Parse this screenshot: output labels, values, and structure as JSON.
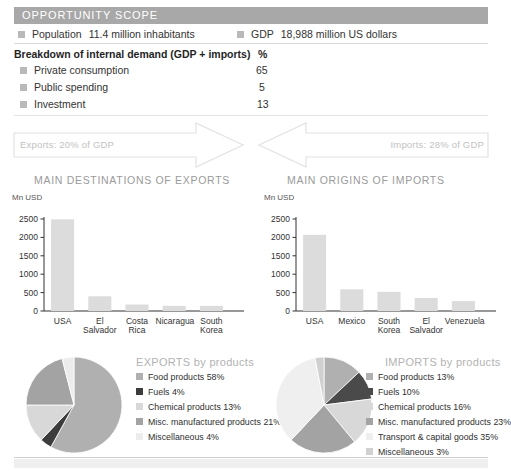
{
  "header": {
    "title": "OPPORTUNITY SCOPE",
    "bar_color": "#a8a8a8"
  },
  "facts": [
    {
      "label": "Population",
      "value": "11.4 million inhabitants"
    },
    {
      "label": "GDP",
      "value": "18,988 million US dollars"
    }
  ],
  "breakdown": {
    "title": "Breakdown of internal demand (GDP + imports)",
    "unit_header": "%",
    "rows": [
      {
        "label": "Private consumption",
        "value": "65"
      },
      {
        "label": "Public spending",
        "value": "5"
      },
      {
        "label": "Investment",
        "value": "13"
      }
    ]
  },
  "flows": {
    "exports_label": "Exports: 20% of GDP",
    "imports_label": "Imports: 28% of GDP"
  },
  "charts": {
    "exports_title": "MAIN DESTINATIONS OF EXPORTS",
    "imports_title": "MAIN ORIGINS OF IMPORTS",
    "unit": "Mn USD"
  },
  "pies": {
    "exports_title": "EXPORTS by products",
    "imports_title": "IMPORTS by products"
  },
  "chart_data": [
    {
      "type": "bar",
      "title": "MAIN DESTINATIONS OF EXPORTS",
      "ylabel": "Mn USD",
      "xlabel": "",
      "ylim": [
        0,
        2500
      ],
      "yticks": [
        "0",
        "500",
        "1000",
        "1500",
        "2000",
        "2500"
      ],
      "categories": [
        "USA",
        "El Salvador",
        "Costa Rica",
        "Nicaragua",
        "South Korea"
      ],
      "values": [
        2490,
        400,
        175,
        140,
        140
      ],
      "grid": false,
      "legend": "none",
      "bar_color": "#dcdcdc"
    },
    {
      "type": "bar",
      "title": "MAIN ORIGINS OF IMPORTS",
      "ylabel": "Mn USD",
      "xlabel": "",
      "ylim": [
        0,
        2500
      ],
      "yticks": [
        "0",
        "500",
        "1000",
        "1500",
        "2000",
        "2500"
      ],
      "categories": [
        "USA",
        "Mexico",
        "South Korea",
        "El Salvador",
        "Venezuela"
      ],
      "values": [
        2070,
        590,
        520,
        355,
        270
      ],
      "grid": false,
      "legend": "none",
      "bar_color": "#dcdcdc"
    },
    {
      "type": "pie",
      "title": "EXPORTS by products",
      "legend": "right",
      "categories": [
        "Food products 58%",
        "Fuels 4%",
        "Chemical products 13%",
        "Misc. manufactured products 21%",
        "Miscellaneous 4%"
      ],
      "labels": [
        "Food products",
        "Fuels",
        "Chemical products",
        "Misc. manufactured products",
        "Miscellaneous"
      ],
      "values": [
        58,
        4,
        13,
        21,
        4
      ],
      "colors": [
        "#b0b0b0",
        "#3c3c3c",
        "#d8d8d8",
        "#a3a3a3",
        "#ececec"
      ]
    },
    {
      "type": "pie",
      "title": "IMPORTS by products",
      "legend": "right",
      "categories": [
        "Food products 13%",
        "Fuels 10%",
        "Chemical products 16%",
        "Misc. manufactured products 23%",
        "Transport & capital goods 35%",
        "Miscellaneous 3%"
      ],
      "labels": [
        "Food products",
        "Fuels",
        "Chemical products",
        "Misc. manufactured products",
        "Transport & capital goods",
        "Miscellaneous"
      ],
      "values": [
        13,
        10,
        16,
        23,
        35,
        3
      ],
      "colors": [
        "#b0b0b0",
        "#4a4a4a",
        "#d8d8d8",
        "#a3a3a3",
        "#efefef",
        "#d0d0d0"
      ]
    }
  ]
}
